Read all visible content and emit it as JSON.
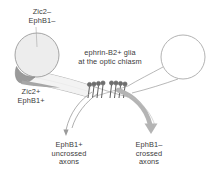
{
  "figure": {
    "background_color": "#ffffff"
  },
  "labels": {
    "top_left": "Zic2–\nEphB1–",
    "bottom_left": "Zic2+\nEphB1+",
    "center": "ephrin-B2+ glia\nat the optic chiasm",
    "bottom_center_left": "EphB1+\nuncrossed\naxons",
    "bottom_center_right": "EphB1–\ncrossed\naxons"
  },
  "colors": {
    "text": "#3b3b3b",
    "outline": "#8f8f8f",
    "retina_fill": "#ededed",
    "ventrotemporal_crescent": "#9a9a9a",
    "thick_arrow": "#b4b4b4",
    "thin_arrow": "#9a9a9a",
    "glia": "#6e6e6e"
  },
  "elements": {
    "left_retina": "filled-circle-with-ventrotemporal-crescent",
    "right_retina": "open-circle",
    "glia_cluster_left": "ephrin-B2+ glia palisade",
    "glia_cluster_right": "ephrin-B2+ glia palisade",
    "uncrossed_arrow": "thin-arrow-ipsilateral",
    "crossed_arrow": "thick-arrow-contralateral"
  }
}
